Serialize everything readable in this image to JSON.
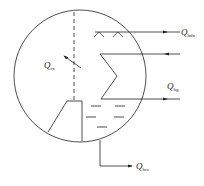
{
  "diagram": {
    "type": "heat-balance schematic of a vessel",
    "colors": {
      "stroke": "#222222",
      "background": "#ffffff"
    },
    "labels": {
      "q_hdx": {
        "symbol": "Q",
        "subscript": "hdx"
      },
      "q_rx": {
        "symbol": "Q",
        "subscript": "rx"
      },
      "q_hg": {
        "symbol": "Q",
        "subscript": "hg"
      },
      "q_hrs": {
        "symbol": "Q",
        "subscript": "hrs"
      }
    },
    "elements": [
      "vessel-circle",
      "dashed-divider",
      "surface-wave-marks",
      "heat-exchange-coil",
      "hopper",
      "liquid-level-dashes",
      "outlet-pipe"
    ]
  }
}
